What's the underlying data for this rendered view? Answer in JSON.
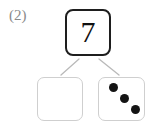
{
  "problem": {
    "number_label": "(2)",
    "type": "number-bond-part-whole"
  },
  "whole": {
    "value": "7",
    "border_color": "#1e1e1e",
    "text_color": "#111111"
  },
  "parts": [
    {
      "id": "left",
      "label": "",
      "dot_count": 0,
      "empty": true,
      "border_color": "#cfcfcf"
    },
    {
      "id": "right",
      "label": "",
      "dot_count": 3,
      "empty": false,
      "border_color": "#cfcfcf",
      "dot_color": "#141414",
      "dots": [
        {
          "cx": 14,
          "cy": 9
        },
        {
          "cx": 25,
          "cy": 20
        },
        {
          "cx": 36,
          "cy": 31
        }
      ]
    }
  ],
  "connectors": {
    "color": "#b9b9b9",
    "left_line": {
      "x1": 79,
      "y1": 59,
      "x2": 61,
      "y2": 75
    },
    "right_line": {
      "x1": 99,
      "y1": 59,
      "x2": 119,
      "y2": 75
    }
  }
}
